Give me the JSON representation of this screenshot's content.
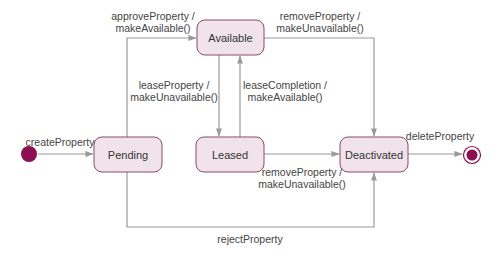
{
  "diagram": {
    "type": "state-machine",
    "states": [
      {
        "id": "available",
        "label": "Available"
      },
      {
        "id": "pending",
        "label": "Pending"
      },
      {
        "id": "leased",
        "label": "Leased"
      },
      {
        "id": "deactivated",
        "label": "Deactivated"
      }
    ],
    "initial_state_target": "pending",
    "final_state_source": "deactivated",
    "colors": {
      "state_fill": "#f1e3ea",
      "state_border": "#8a4a66",
      "pseudo_state": "#8b1050",
      "edge": "#9a9a9a"
    },
    "transitions": {
      "create": {
        "from": "initial",
        "to": "pending",
        "line1": "createProperty",
        "line2": ""
      },
      "approve": {
        "from": "pending",
        "to": "available",
        "line1": "approveProperty /",
        "line2": "makeAvailable()"
      },
      "remove_available": {
        "from": "available",
        "to": "deactivated",
        "line1": "removeProperty /",
        "line2": "makeUnavailable()"
      },
      "lease": {
        "from": "available",
        "to": "leased",
        "line1": "leaseProperty /",
        "line2": "makeUnavailable()"
      },
      "lease_completion": {
        "from": "leased",
        "to": "available",
        "line1": "leaseCompletion /",
        "line2": "makeAvailable()"
      },
      "remove_leased": {
        "from": "leased",
        "to": "deactivated",
        "line1": "removeProperty /",
        "line2": "makeUnavailable()"
      },
      "delete": {
        "from": "deactivated",
        "to": "final",
        "line1": "deleteProperty",
        "line2": ""
      },
      "reject": {
        "from": "pending",
        "to": "deactivated",
        "line1": "rejectProperty",
        "line2": ""
      }
    }
  }
}
